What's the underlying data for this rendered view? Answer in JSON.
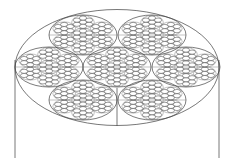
{
  "diagram": {
    "type": "wire-rope-cross-section",
    "colors": {
      "background": "#ffffff",
      "line": "#555555",
      "wire": "#222222"
    },
    "outer": {
      "cx": 117,
      "cy": 67.5,
      "rx": 102,
      "ry": 58
    },
    "side_lines": [
      {
        "x": 15,
        "y1": 60,
        "y2": 158
      },
      {
        "x": 219,
        "y1": 60,
        "y2": 158
      }
    ],
    "center_line": {
      "x": 117,
      "y1": 88,
      "y2": 126
    },
    "strand": {
      "rx": 34,
      "ry": 20
    },
    "strands": [
      {
        "cx": 83,
        "cy": 35
      },
      {
        "cx": 152,
        "cy": 35
      },
      {
        "cx": 49,
        "cy": 67
      },
      {
        "cx": 117,
        "cy": 67
      },
      {
        "cx": 186,
        "cy": 67
      },
      {
        "cx": 83,
        "cy": 100
      },
      {
        "cx": 152,
        "cy": 100
      }
    ],
    "sub_strand": {
      "rx": 11.3,
      "ry": 6.7
    },
    "wire": {
      "rx": 3.6,
      "ry": 2.1
    }
  }
}
